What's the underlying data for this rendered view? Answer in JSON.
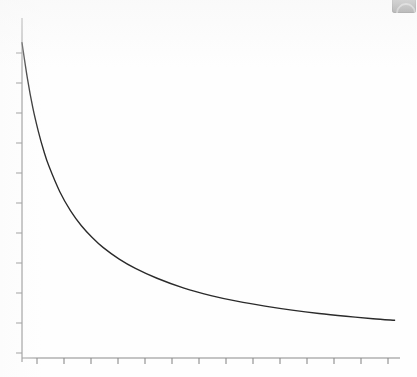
{
  "figure": {
    "background_color": "#fefefe",
    "axis_color": "#8a8a8a",
    "curve_color": "#2a2a2a",
    "artifact": {
      "name": "corner-widget-artifact",
      "color": "#9d9d9d",
      "glyph_color": "#cfcfcf"
    }
  },
  "chart_data": {
    "type": "line",
    "title": "",
    "subtitle": "",
    "xlabel": "",
    "ylabel": "",
    "legend": [],
    "annotations": [],
    "grid": false,
    "legend_position": "none",
    "xlim": [
      0,
      14
    ],
    "ylim": [
      0,
      11
    ],
    "x_tick_labels": [],
    "y_tick_labels": [],
    "x_tick_count": 14,
    "y_tick_count": 11,
    "x_tick_values": [
      1,
      2,
      3,
      4,
      5,
      6,
      7,
      8,
      9,
      10,
      11,
      12,
      13,
      14
    ],
    "y_tick_values": [
      1,
      2,
      3,
      4,
      5,
      6,
      7,
      8,
      9,
      10,
      11
    ],
    "series": [
      {
        "name": "decay",
        "description": "monotonic decreasing inverse-power decay",
        "x": [
          0.0,
          0.2,
          0.4,
          0.6,
          0.8,
          1.0,
          1.4,
          1.8,
          2.2,
          2.6,
          3.0,
          3.6,
          4.2,
          5.0,
          6.0,
          7.0,
          8.0,
          9.0,
          10.0,
          11.0,
          12.0,
          13.0,
          13.8
        ],
        "y": [
          10.2,
          9.05,
          8.1,
          7.35,
          6.72,
          6.2,
          5.38,
          4.76,
          4.28,
          3.9,
          3.58,
          3.2,
          2.9,
          2.58,
          2.26,
          2.02,
          1.83,
          1.68,
          1.55,
          1.44,
          1.35,
          1.27,
          1.22
        ]
      }
    ]
  },
  "plot_geometry": {
    "y_axis_x": 22,
    "y_axis_top": 18,
    "y_axis_bottom": 362,
    "x_axis_y": 358,
    "x_axis_left": 22,
    "x_axis_right": 400,
    "y_first_tick": 53,
    "y_tick_spacing": 30,
    "x_first_tick": 37,
    "x_tick_spacing": 27,
    "tick_length": 6,
    "curve_start": [
      22,
      53
    ],
    "curve_end": [
      393,
      322
    ]
  }
}
